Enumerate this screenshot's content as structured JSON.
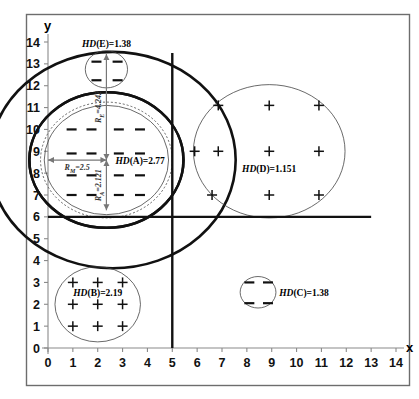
{
  "figure": {
    "title": "",
    "frame": true
  },
  "axes": {
    "x_name": "x",
    "y_name": "y",
    "x_ticks": [
      "0",
      "1",
      "2",
      "3",
      "4",
      "5",
      "6",
      "7",
      "8",
      "9",
      "10",
      "11",
      "12",
      "13",
      "14"
    ],
    "y_ticks": [
      "0",
      "1",
      "2",
      "3",
      "4",
      "5",
      "6",
      "7",
      "8",
      "9",
      "10",
      "11",
      "12",
      "13",
      "14"
    ]
  },
  "chart_data": {
    "type": "scatter",
    "title": "",
    "xlabel": "x",
    "ylabel": "y",
    "xlim": [
      0,
      14
    ],
    "ylim": [
      0,
      14
    ],
    "grid": false,
    "legend": "none",
    "x_ticks": [
      0,
      1,
      2,
      3,
      4,
      5,
      6,
      7,
      8,
      9,
      10,
      11,
      12,
      13,
      14
    ],
    "y_ticks": [
      0,
      1,
      2,
      3,
      4,
      5,
      6,
      7,
      8,
      9,
      10,
      11,
      12,
      13,
      14
    ],
    "separators": [
      {
        "name": "vertical-split",
        "orientation": "vertical",
        "value": 5,
        "from": 0,
        "to": 13.5
      },
      {
        "name": "horizontal-split",
        "orientation": "horizontal",
        "value": 6,
        "from": 0,
        "to": 13.0
      }
    ],
    "clusters": [
      {
        "id": "A",
        "label": "HD(A)=2.77",
        "hd": 2.77,
        "center": [
          2.35,
          8.6
        ],
        "marker": "dash",
        "circles": [
          {
            "name": "outer-thick",
            "radius": 3.1,
            "style": "thick"
          },
          {
            "name": "mid-dotted",
            "radius": 2.65,
            "style": "dotted"
          },
          {
            "name": "inner-thin",
            "radius": 2.5,
            "style": "thin"
          }
        ],
        "points": [
          [
            0.95,
            10.0
          ],
          [
            1.75,
            10.0
          ],
          [
            2.85,
            10.0
          ],
          [
            3.7,
            10.0
          ],
          [
            0.95,
            8.9
          ],
          [
            1.75,
            8.9
          ],
          [
            2.85,
            8.9
          ],
          [
            3.7,
            8.9
          ],
          [
            0.95,
            7.9
          ],
          [
            1.75,
            7.9
          ],
          [
            2.85,
            7.9
          ],
          [
            3.7,
            7.9
          ],
          [
            0.95,
            7.0
          ],
          [
            1.75,
            7.0
          ],
          [
            2.85,
            7.0
          ],
          [
            3.7,
            7.0
          ]
        ]
      },
      {
        "id": "B",
        "label": "HD(B)=2.19",
        "hd": 2.19,
        "center": [
          2.0,
          2.0
        ],
        "marker": "plus",
        "circles": [
          {
            "name": "boundary",
            "radius": 1.72,
            "style": "thin"
          }
        ],
        "points": [
          [
            1,
            3
          ],
          [
            2,
            3
          ],
          [
            3,
            3
          ],
          [
            1,
            2
          ],
          [
            2,
            2
          ],
          [
            3,
            2
          ],
          [
            1,
            1
          ],
          [
            2,
            1
          ],
          [
            3,
            1
          ]
        ]
      },
      {
        "id": "C",
        "label": "HD(C)=1.38",
        "hd": 1.38,
        "center": [
          8.45,
          2.55
        ],
        "marker": "dash",
        "circles": [
          {
            "name": "boundary",
            "radius": 0.72,
            "style": "thin"
          }
        ],
        "points": [
          [
            8.1,
            3.0
          ],
          [
            8.85,
            3.0
          ],
          [
            8.1,
            2.05
          ],
          [
            8.85,
            2.05
          ]
        ]
      },
      {
        "id": "D",
        "label": "HD(D)=1.151",
        "hd": 1.151,
        "center": [
          8.9,
          9.0
        ],
        "marker": "plus",
        "circles": [
          {
            "name": "boundary",
            "radius": 3.05,
            "style": "thin"
          }
        ],
        "points": [
          [
            6.85,
            11.1
          ],
          [
            8.9,
            11.1
          ],
          [
            10.9,
            11.1
          ],
          [
            5.9,
            9.0
          ],
          [
            6.85,
            9.0
          ],
          [
            8.9,
            9.0
          ],
          [
            10.9,
            9.0
          ],
          [
            6.6,
            7.0
          ],
          [
            8.9,
            7.0
          ],
          [
            10.9,
            7.0
          ]
        ]
      },
      {
        "id": "E",
        "label": "HD(E)=1.38",
        "hd": 1.38,
        "center": [
          2.35,
          12.75
        ],
        "marker": "dash",
        "circles": [
          {
            "name": "boundary",
            "radius": 0.85,
            "style": "thin"
          }
        ],
        "points": [
          [
            1.95,
            13.1
          ],
          [
            2.8,
            13.1
          ],
          [
            1.95,
            12.25
          ],
          [
            2.8,
            12.25
          ]
        ]
      }
    ],
    "enclosing_circles": [
      {
        "name": "big-outer-circle",
        "center": [
          2.6,
          8.6
        ],
        "radius": 4.95,
        "style": "thick"
      },
      {
        "name": "big-inner-circle",
        "center": [
          2.35,
          8.6
        ],
        "radius": 3.1,
        "style": "thick"
      }
    ],
    "radius_annotations": [
      {
        "name": "radius-top",
        "label": "R=4.242",
        "value": 4.242,
        "from": [
          2.35,
          8.6
        ],
        "to": [
          2.35,
          13.45
        ],
        "orientation": "vertical-up"
      },
      {
        "name": "radius-bottom",
        "label": "R=2.121",
        "value": 2.121,
        "from": [
          2.35,
          8.6
        ],
        "to": [
          2.35,
          6.3
        ],
        "orientation": "vertical-down"
      },
      {
        "name": "radius-left",
        "label": "R=2.5",
        "value": 2.5,
        "from": [
          2.35,
          8.6
        ],
        "to": [
          0.0,
          8.6
        ],
        "orientation": "horizontal-left"
      }
    ]
  },
  "labels": {
    "a": "HD(A)=2.77",
    "b": "HD(B)=2.19",
    "c": "HD(C)=1.38",
    "d": "HD(D)=1.151",
    "e": "HD(E)=1.38",
    "r_top": "=4.242",
    "r_bottom": "=2.121",
    "r_left": "=2.5",
    "r_sym": "R",
    "r_sub_top": "E",
    "r_sub_bottom": "A",
    "r_sub_left": "M"
  },
  "colors": {
    "stroke_dark": "#111111",
    "stroke_mid": "#444444",
    "axis": "#8a8a8a",
    "frame": "#6d6d6d",
    "background": "#ffffff"
  }
}
